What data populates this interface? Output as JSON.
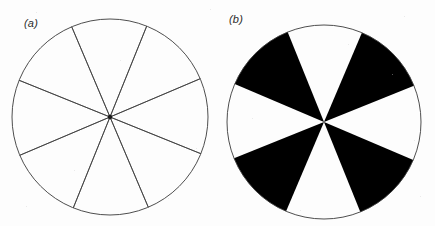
{
  "figure": {
    "background_color": "#fdfdfd",
    "ink_color": "#3a3a3a",
    "fill_color": "#000000",
    "panels": [
      {
        "id": "a",
        "label": "(a)",
        "description": "Outline circle divided into eight sectors by thin radial lines",
        "circle": {
          "cx": 110,
          "cy": 117,
          "r": 98
        },
        "outline_width": 0.9,
        "spoke_width": 0.8,
        "sector_count": 8,
        "start_angle_deg": 22,
        "sector_angles_deg": [
          22,
          67,
          112,
          157,
          202,
          247,
          292,
          337
        ],
        "sector_fills": [
          "none",
          "none",
          "none",
          "none",
          "none",
          "none",
          "none",
          "none"
        ],
        "center_dot_radius": 2.2
      },
      {
        "id": "b",
        "label": "(b)",
        "description": "Same eight-sector circle with alternating sectors filled solid black",
        "circle": {
          "cx": 106,
          "cy": 122,
          "r": 97
        },
        "outline_width": 0.9,
        "spoke_width": 0,
        "sector_count": 8,
        "start_angle_deg": 23,
        "sector_angles_deg": [
          23,
          68,
          113,
          158,
          203,
          248,
          293,
          338
        ],
        "sector_fills": [
          "black",
          "white",
          "black",
          "white",
          "black",
          "white",
          "black",
          "white"
        ],
        "center_dot_radius": 0
      }
    ]
  },
  "chart_data": {
    "type": "pie",
    "title": "",
    "subtitle": "",
    "xlabel": "",
    "ylabel": "",
    "legend": [],
    "charts": [
      {
        "panel": "a",
        "label": "(a)",
        "categories": [
          "s1",
          "s2",
          "s3",
          "s4",
          "s5",
          "s6",
          "s7",
          "s8"
        ],
        "values": [
          45,
          45,
          45,
          45,
          45,
          45,
          45,
          45
        ],
        "units": "degrees",
        "colors": [
          "none",
          "none",
          "none",
          "none",
          "none",
          "none",
          "none",
          "none"
        ],
        "stroke": "#3a3a3a"
      },
      {
        "panel": "b",
        "label": "(b)",
        "categories": [
          "s1",
          "s2",
          "s3",
          "s4",
          "s5",
          "s6",
          "s7",
          "s8"
        ],
        "values": [
          45,
          45,
          45,
          45,
          45,
          45,
          45,
          45
        ],
        "units": "degrees",
        "colors": [
          "#000000",
          "#ffffff",
          "#000000",
          "#ffffff",
          "#000000",
          "#ffffff",
          "#000000",
          "#ffffff"
        ],
        "stroke": "#3a3a3a"
      }
    ]
  }
}
